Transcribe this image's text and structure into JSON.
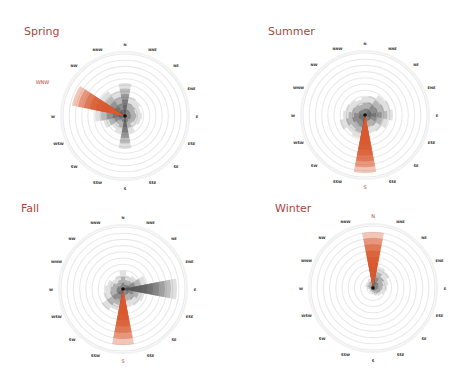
{
  "chart_data": [
    {
      "type": "rose",
      "title": "Spring",
      "center": [
        125,
        116
      ],
      "highlight_direction": "WNW",
      "directions": [
        "N",
        "NNE",
        "NE",
        "ENE",
        "E",
        "ESE",
        "SE",
        "SSE",
        "S",
        "SSW",
        "SW",
        "WSW",
        "W",
        "WNW",
        "NW",
        "NNW"
      ],
      "values": [
        33,
        20,
        18,
        16,
        17,
        16,
        14,
        18,
        33,
        18,
        16,
        22,
        30,
        54,
        30,
        26
      ]
    },
    {
      "type": "rose",
      "title": "Summer",
      "center": [
        365,
        115
      ],
      "highlight_direction": "S",
      "directions": [
        "N",
        "NNE",
        "NE",
        "ENE",
        "E",
        "ESE",
        "SE",
        "SSE",
        "S",
        "SSW",
        "SW",
        "WSW",
        "W",
        "WNW",
        "NW",
        "NNW"
      ],
      "values": [
        18,
        20,
        24,
        26,
        28,
        24,
        20,
        18,
        58,
        24,
        22,
        26,
        22,
        20,
        18,
        16
      ]
    },
    {
      "type": "rose",
      "title": "Fall",
      "center": [
        123,
        289
      ],
      "highlight_direction": "S",
      "directions": [
        "N",
        "NNE",
        "NE",
        "ENE",
        "E",
        "ESE",
        "SE",
        "SSE",
        "S",
        "SSW",
        "SW",
        "WSW",
        "W",
        "WNW",
        "NW",
        "NNW"
      ],
      "values": [
        18,
        14,
        16,
        24,
        54,
        22,
        20,
        18,
        56,
        22,
        26,
        20,
        18,
        16,
        12,
        14
      ]
    },
    {
      "type": "rose",
      "title": "Winter",
      "center": [
        373,
        288
      ],
      "highlight_direction": "N",
      "directions": [
        "N",
        "NNE",
        "NE",
        "ENE",
        "E",
        "ESE",
        "SE",
        "SSE",
        "S",
        "SSW",
        "SW",
        "WSW",
        "W",
        "WNW",
        "NW",
        "NNW"
      ],
      "values": [
        56,
        22,
        20,
        16,
        14,
        12,
        10,
        8,
        6,
        5,
        5,
        4,
        6,
        8,
        8,
        10
      ]
    }
  ],
  "panels": [
    {
      "title": "Spring"
    },
    {
      "title": "Summer"
    },
    {
      "title": "Fall"
    },
    {
      "title": "Winter"
    }
  ],
  "colors": {
    "highlight": "#d9582e",
    "bar": "#555555",
    "ring": "#e9e9e9",
    "title": "#a8473c"
  }
}
